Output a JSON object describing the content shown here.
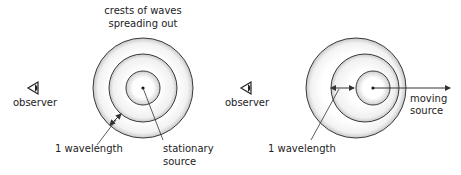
{
  "stationary": {
    "title_line1": "crests of waves",
    "title_line2": "spreading out",
    "observer_label": "observer",
    "wavelength_label": "1 wavelength",
    "source_line1": "stationary",
    "source_line2": "source"
  },
  "moving": {
    "observer_label": "observer",
    "wavelength_label": "1 wavelength",
    "source_line1": "moving",
    "source_line2": "source"
  },
  "icons": {
    "observer": "eye-icon"
  },
  "colors": {
    "stroke": "#3a3a3a",
    "ring_shade": "#d0d0d0",
    "text": "#222222"
  }
}
